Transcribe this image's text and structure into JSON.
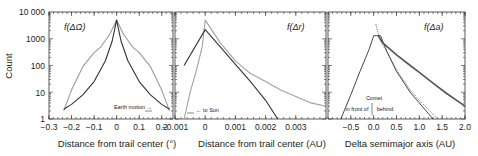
{
  "figure": {
    "ylabel": "Count",
    "yticks": [
      {
        "label": "10 000",
        "value": 10000
      },
      {
        "label": "1000",
        "value": 1000
      },
      {
        "label": "100",
        "value": 100
      },
      {
        "label": "10",
        "value": 10
      },
      {
        "label": "1",
        "value": 1
      }
    ]
  },
  "chart_data": [
    {
      "type": "line",
      "panel_label": "f(ΔΩ)",
      "xlabel": "Distance from trail center (°)",
      "ylabel": "Count",
      "yscale": "log",
      "xlim": [
        -0.3,
        0.25
      ],
      "ylim": [
        1,
        10000
      ],
      "xtick_labels": [
        "−0.3",
        "−0.2",
        "−0.1",
        "0",
        "0.1",
        "0.2"
      ],
      "xticks": [
        -0.3,
        -0.2,
        -0.1,
        0,
        0.1,
        0.2
      ],
      "annotations": [
        "Earth motion →"
      ],
      "series": [
        {
          "name": "simulated distribution (gray, noisy)",
          "x": [
            -0.235,
            -0.2,
            -0.15,
            -0.1,
            -0.07,
            -0.03,
            0,
            0.03,
            0.07,
            0.1,
            0.15,
            0.2,
            0.235
          ],
          "y": [
            2,
            12,
            90,
            300,
            500,
            1500,
            5000,
            1500,
            500,
            300,
            90,
            12,
            2
          ]
        },
        {
          "name": "model fit (black)",
          "x": [
            -0.235,
            -0.2,
            -0.15,
            -0.1,
            -0.05,
            -0.02,
            0,
            0.02,
            0.05,
            0.1,
            0.15,
            0.2,
            0.235
          ],
          "y": [
            2.3,
            3.5,
            8,
            25,
            150,
            800,
            5000,
            800,
            150,
            25,
            8,
            3.5,
            2.3
          ]
        }
      ]
    },
    {
      "type": "line",
      "panel_label": "f(Δr)",
      "xlabel": "Distance from trail center (AU)",
      "ylabel": "Count",
      "yscale": "log",
      "xlim": [
        -0.001,
        0.004
      ],
      "ylim": [
        1,
        10000
      ],
      "xtick_labels": [
        "−0.001",
        "0",
        "0.001",
        "0.002",
        "0.003"
      ],
      "xticks": [
        -0.001,
        0,
        0.001,
        0.002,
        0.003
      ],
      "annotations": [
        "← to Sun"
      ],
      "series": [
        {
          "name": "simulated distribution (gray, noisy)",
          "x": [
            -0.0007,
            -0.0005,
            -0.0003,
            -0.0001,
            0,
            0.0005,
            0.001,
            0.0015,
            0.002,
            0.0025,
            0.003,
            0.0035,
            0.004
          ],
          "y": [
            1,
            10,
            60,
            500,
            5000,
            700,
            150,
            50,
            25,
            12,
            7,
            4,
            3
          ]
        },
        {
          "name": "model fit (black)",
          "x": [
            -0.0007,
            0,
            0.0005,
            0.001,
            0.0015,
            0.002,
            0.0024
          ],
          "y": [
            100,
            2200,
            500,
            110,
            25,
            5,
            1
          ]
        }
      ]
    },
    {
      "type": "line",
      "panel_label": "f(Δa)",
      "xlabel": "Delta semimajor axis (AU)",
      "ylabel": "Count",
      "yscale": "log",
      "xlim": [
        -1.0,
        2.0
      ],
      "ylim": [
        1,
        10000
      ],
      "xtick_labels": [
        "−0.5",
        "0.0",
        "0.5",
        "1.0",
        "1.5",
        "2.0"
      ],
      "xticks": [
        -0.5,
        0.0,
        0.5,
        1.0,
        1.5,
        2.0
      ],
      "annotations": [
        "Comet",
        "in front of",
        "behind"
      ],
      "series": [
        {
          "name": "solid curve (left edge + core)",
          "x": [
            -0.72,
            -0.5,
            -0.3,
            -0.1,
            0.0,
            0.1,
            0.15,
            0.3,
            0.5,
            0.8,
            1.0,
            1.3
          ],
          "y": [
            1,
            8,
            60,
            400,
            1300,
            1300,
            1300,
            300,
            60,
            10,
            4,
            1
          ]
        },
        {
          "name": "dotted curve",
          "x": [
            0.05,
            0.1,
            0.15,
            0.3,
            0.5,
            0.8,
            1.0,
            1.4
          ],
          "y": [
            3500,
            1500,
            800,
            300,
            70,
            12,
            5,
            1
          ]
        },
        {
          "name": "noisy tail (dark gray)",
          "x": [
            0.1,
            0.2,
            0.5,
            0.8,
            1.0,
            1.3,
            1.6,
            2.0
          ],
          "y": [
            1300,
            700,
            250,
            100,
            55,
            22,
            9,
            3
          ]
        }
      ]
    }
  ]
}
